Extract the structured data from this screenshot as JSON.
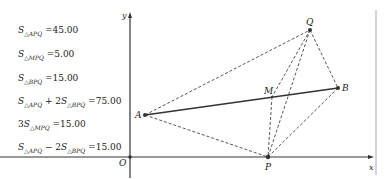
{
  "formulas": [
    {
      "prefix": "",
      "main": "S",
      "sub": "△APQ",
      "rest": "=45.00"
    },
    {
      "prefix": "",
      "main": "S",
      "sub": "△MPQ",
      "rest": "=5.00"
    },
    {
      "prefix": "",
      "main": "S",
      "sub": "△BPQ",
      "rest": "=15.00"
    },
    {
      "prefix": "",
      "main": "S",
      "sub": "△APQ",
      "mid": " + 2",
      "main2": "S",
      "sub2": "△BPQ",
      "rest": "=75.00"
    },
    {
      "prefix": "3",
      "main": "S",
      "sub": "△MPQ",
      "rest": "=15.00"
    },
    {
      "prefix": "",
      "main": "S",
      "sub": "△APQ",
      "mid": " − 2",
      "main2": "S",
      "sub2": "△BPQ",
      "rest": "=15.00"
    }
  ],
  "axes": {
    "x_label": "x",
    "y_label": "y",
    "origin_label": "O"
  },
  "points": {
    "A": {
      "label": "A",
      "x": 145,
      "y": 115
    },
    "B": {
      "label": "B",
      "x": 338,
      "y": 88
    },
    "Q": {
      "label": "Q",
      "x": 310,
      "y": 30
    },
    "P": {
      "label": "P",
      "x": 268,
      "y": 157
    },
    "M": {
      "label": "M",
      "x": 272,
      "y": 97
    }
  },
  "colors": {
    "line": "#333333",
    "dash": "#444444",
    "axis": "#333333",
    "border": "#999999"
  }
}
